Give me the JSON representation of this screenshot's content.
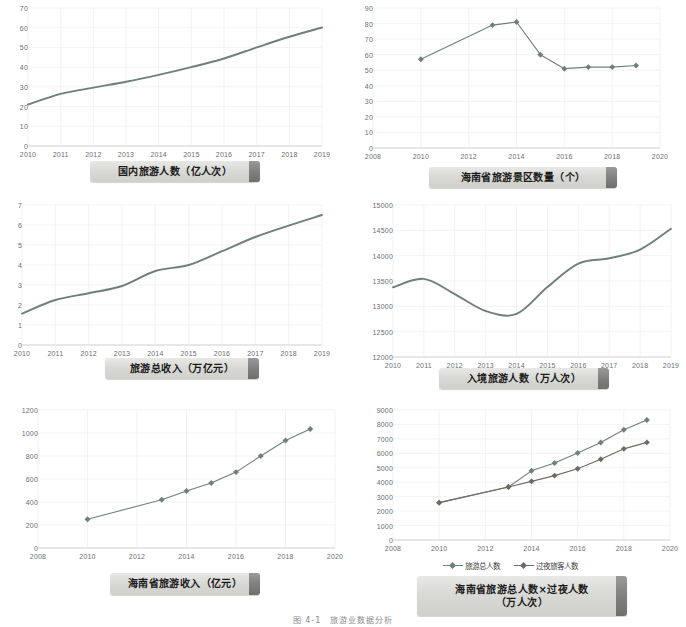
{
  "page": {
    "caption": "图 4-1　旅游业数据分析"
  },
  "palette": {
    "line": "#6e807d",
    "line_alt": "#6f6b63",
    "grid": "#eceeed",
    "axis": "#d9dbda",
    "tick_text": "#6d6e71",
    "plaque_text": "#1b1b1b"
  },
  "charts": [
    {
      "id": "domestic-tourists",
      "title": "国内旅游人数（亿人次）",
      "chart_data": {
        "type": "line",
        "title": "国内旅游人数（亿人次）",
        "xlabel": "",
        "ylabel": "亿人次",
        "x": [
          2010,
          2011,
          2012,
          2013,
          2014,
          2015,
          2016,
          2017,
          2018,
          2019
        ],
        "xtick_labels": [
          "2010",
          "2011",
          "2012",
          "2013",
          "2014",
          "2015",
          "2016",
          "2017",
          "2018",
          "2019"
        ],
        "ytick_labels": [
          "0",
          "10",
          "20",
          "30",
          "40",
          "50",
          "60",
          "70"
        ],
        "xlim": [
          2010,
          2019
        ],
        "ylim": [
          0,
          70
        ],
        "grid": true,
        "markers": false,
        "legend": null,
        "series": [
          {
            "name": "国内旅游人数",
            "values": [
              21.0,
              26.4,
              29.6,
              32.6,
              36.1,
              40.0,
              44.4,
              50.0,
              55.4,
              60.1
            ]
          }
        ]
      }
    },
    {
      "id": "hainan-scenic-spots",
      "title": "海南省旅游景区数量（个）",
      "chart_data": {
        "type": "line",
        "title": "海南省旅游景区数量（个）",
        "xlabel": "",
        "ylabel": "个",
        "xtick_labels": [
          "2008",
          "2010",
          "2012",
          "2014",
          "2016",
          "2018",
          "2020"
        ],
        "ytick_labels": [
          "0",
          "10",
          "20",
          "30",
          "40",
          "50",
          "60",
          "70",
          "80",
          "90"
        ],
        "xlim": [
          2008,
          2020
        ],
        "ylim": [
          0,
          90
        ],
        "grid": true,
        "markers": true,
        "legend": null,
        "series": [
          {
            "name": "海南省旅游景区数量",
            "x": [
              2010,
              2013,
              2014,
              2015,
              2016,
              2017,
              2018,
              2019
            ],
            "values": [
              57,
              79,
              81,
              60,
              51,
              52,
              52,
              53
            ]
          }
        ]
      }
    },
    {
      "id": "total-tourism-revenue",
      "title": "旅游总收入（万亿元）",
      "chart_data": {
        "type": "line",
        "title": "旅游总收入（万亿元）",
        "xlabel": "",
        "ylabel": "万亿元",
        "x": [
          2010,
          2011,
          2012,
          2013,
          2014,
          2015,
          2016,
          2017,
          2018,
          2019
        ],
        "xtick_labels": [
          "2010",
          "2011",
          "2012",
          "2013",
          "2014",
          "2015",
          "2016",
          "2017",
          "2018",
          "2019"
        ],
        "ytick_labels": [
          "0",
          "1",
          "2",
          "3",
          "4",
          "5",
          "6",
          "7"
        ],
        "xlim": [
          2010,
          2019
        ],
        "ylim": [
          0,
          7
        ],
        "grid": true,
        "markers": false,
        "legend": null,
        "series": [
          {
            "name": "旅游总收入",
            "values": [
              1.57,
              2.25,
              2.59,
              2.95,
              3.7,
              4.0,
              4.69,
              5.4,
              5.97,
              6.5
            ]
          }
        ]
      }
    },
    {
      "id": "inbound-tourists",
      "title": "入境旅游人数（万人次）",
      "chart_data": {
        "type": "line",
        "title": "入境旅游人数（万人次）",
        "xlabel": "",
        "ylabel": "万人次",
        "x": [
          2010,
          2011,
          2012,
          2013,
          2014,
          2015,
          2016,
          2017,
          2018,
          2019
        ],
        "xtick_labels": [
          "2010",
          "2011",
          "2012",
          "2013",
          "2014",
          "2015",
          "2016",
          "2017",
          "2018",
          "2019"
        ],
        "ytick_labels": [
          "12000",
          "12500",
          "13000",
          "13500",
          "14000",
          "14500",
          "15000"
        ],
        "xlim": [
          2010,
          2019
        ],
        "ylim": [
          12000,
          15000
        ],
        "grid": true,
        "markers": false,
        "legend": null,
        "series": [
          {
            "name": "入境旅游人数",
            "values": [
              13376,
              13542,
              13241,
              12908,
              12850,
              13382,
              13844,
              13948,
              14120,
              14531
            ]
          }
        ]
      }
    },
    {
      "id": "hainan-tourism-revenue",
      "title": "海南省旅游收入（亿元）",
      "chart_data": {
        "type": "line",
        "title": "海南省旅游收入（亿元）",
        "xlabel": "",
        "ylabel": "亿元",
        "xtick_labels": [
          "2008",
          "2010",
          "2012",
          "2014",
          "2016",
          "2018",
          "2020"
        ],
        "ytick_labels": [
          "0",
          "200",
          "400",
          "600",
          "800",
          "1000",
          "1200"
        ],
        "xlim": [
          2008,
          2020
        ],
        "ylim": [
          0,
          1200
        ],
        "grid": true,
        "markers": true,
        "legend": null,
        "series": [
          {
            "name": "海南省旅游收入",
            "x": [
              2010,
              2013,
              2014,
              2015,
              2016,
              2017,
              2018,
              2019
            ],
            "values": [
              250,
              420,
              495,
              565,
              660,
              800,
              935,
              1035
            ]
          }
        ]
      }
    },
    {
      "id": "hainan-total-and-overnight",
      "title_line1": "海南省旅游总人数×过夜人数",
      "title_line2": "（万人次）",
      "chart_data": {
        "type": "line",
        "title": "海南省旅游总人数×过夜人数（万人次）",
        "xlabel": "",
        "ylabel": "万人次",
        "xtick_labels": [
          "2008",
          "2010",
          "2012",
          "2014",
          "2016",
          "2018",
          "2020"
        ],
        "ytick_labels": [
          "0",
          "1000",
          "2000",
          "3000",
          "4000",
          "5000",
          "6000",
          "7000",
          "8000",
          "9000"
        ],
        "xlim": [
          2008,
          2020
        ],
        "ylim": [
          0,
          9000
        ],
        "grid": true,
        "markers": true,
        "legend_position": "bottom",
        "series": [
          {
            "name": "旅游总人数",
            "color": "#6e807d",
            "x": [
              2010,
              2013,
              2014,
              2015,
              2016,
              2017,
              2018,
              2019
            ],
            "values": [
              2587,
              3672,
              4789,
              5336,
              6024,
              6745,
              7627,
              8311
            ]
          },
          {
            "name": "过夜旅客人数",
            "color": "#6f6b63",
            "x": [
              2010,
              2013,
              2014,
              2015,
              2016,
              2017,
              2018,
              2019
            ],
            "values": [
              2587,
              3672,
              4060,
              4458,
              4928,
              5595,
              6310,
              6757
            ]
          }
        ]
      }
    }
  ]
}
